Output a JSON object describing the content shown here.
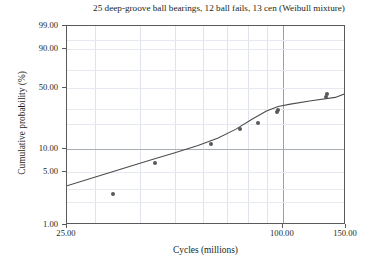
{
  "chart_data": {
    "type": "scatter",
    "title": "25 deep-groove ball bearings, 12 ball fails, 13 cen (Weibull mixture)",
    "xlabel": "Cycles (millions)",
    "ylabel": "Cumulative probability (%)",
    "xscale": "log",
    "yscale": "weibull-probability",
    "xlim": [
      25.0,
      150.0
    ],
    "ylim": [
      1.0,
      99.0
    ],
    "grid": true,
    "legend": "none",
    "x_ticks": [
      {
        "value": 25.0,
        "label": "25.00"
      },
      {
        "value": 100.0,
        "label": "100.00"
      },
      {
        "value": 150.0,
        "label": "150.00"
      }
    ],
    "x_gridlines": [
      30,
      40,
      50,
      60,
      70,
      80,
      90,
      100
    ],
    "y_ticks": [
      {
        "value": 99.0,
        "label": "99.00"
      },
      {
        "value": 90.0,
        "label": "90.00"
      },
      {
        "value": 50.0,
        "label": "50.00"
      },
      {
        "value": 10.0,
        "label": "10.00"
      },
      {
        "value": 5.0,
        "label": "5.00"
      },
      {
        "value": 1.0,
        "label": "1.00"
      }
    ],
    "y_gridlines": [
      2,
      3,
      5,
      10,
      20,
      30,
      50,
      70,
      90,
      95
    ],
    "series": [
      {
        "name": "Failure data (nonparametric estimate)",
        "marker": "filled-circle",
        "color": "#595959",
        "points": [
          {
            "x": 33.5,
            "y": 2.6
          },
          {
            "x": 44.0,
            "y": 6.6
          },
          {
            "x": 63.0,
            "y": 11.5
          },
          {
            "x": 76.0,
            "y": 17.5
          },
          {
            "x": 85.0,
            "y": 21.0
          },
          {
            "x": 96.0,
            "y": 27.5
          },
          {
            "x": 97.0,
            "y": 29.5
          },
          {
            "x": 132.0,
            "y": 40.0
          },
          {
            "x": 133.0,
            "y": 43.5
          },
          {
            "x": 168.0,
            "y": 47.5
          },
          {
            "x": 183.0,
            "y": 52.0
          },
          {
            "x": 245.0,
            "y": 60.0
          }
        ]
      },
      {
        "name": "Weibull mixture fit",
        "type": "line",
        "color": "#4d4d4d",
        "points": [
          {
            "x": 25.0,
            "y": 3.3
          },
          {
            "x": 30.0,
            "y": 4.3
          },
          {
            "x": 36.0,
            "y": 5.6
          },
          {
            "x": 43.0,
            "y": 7.2
          },
          {
            "x": 50.0,
            "y": 8.9
          },
          {
            "x": 58.0,
            "y": 11.0
          },
          {
            "x": 66.0,
            "y": 13.6
          },
          {
            "x": 74.0,
            "y": 17.5
          },
          {
            "x": 82.0,
            "y": 23.0
          },
          {
            "x": 90.0,
            "y": 28.5
          },
          {
            "x": 97.0,
            "y": 32.0
          },
          {
            "x": 105.0,
            "y": 34.0
          },
          {
            "x": 120.0,
            "y": 37.0
          },
          {
            "x": 140.0,
            "y": 40.0
          },
          {
            "x": 165.0,
            "y": 44.0
          },
          {
            "x": 195.0,
            "y": 49.0
          },
          {
            "x": 230.0,
            "y": 55.0
          },
          {
            "x": 260.0,
            "y": 59.5
          }
        ]
      }
    ]
  }
}
